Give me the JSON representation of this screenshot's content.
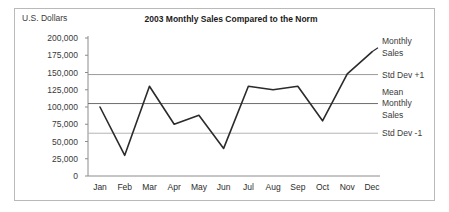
{
  "chart_data": {
    "type": "line",
    "title": "2003 Monthly Sales Compared to the Norm",
    "ylabel": "U.S. Dollars",
    "xlabel": "",
    "categories": [
      "Jan",
      "Feb",
      "Mar",
      "Apr",
      "May",
      "Jun",
      "Jul",
      "Aug",
      "Sep",
      "Oct",
      "Nov",
      "Dec"
    ],
    "series": [
      {
        "name": "Monthly Sales",
        "values": [
          100000,
          30000,
          130000,
          75000,
          88000,
          40000,
          130000,
          125000,
          130000,
          80000,
          148000,
          180000
        ]
      }
    ],
    "reference_lines": [
      {
        "name": "Std Dev +1",
        "label": "Std Dev +1",
        "value": 147000,
        "color": "#9a9a9a"
      },
      {
        "name": "Mean Monthly Sales",
        "label": "Mean\nMonthly\nSales",
        "value": 105000,
        "color": "#6e6e6e"
      },
      {
        "name": "Std Dev -1",
        "label": "Std Dev -1",
        "value": 62000,
        "color": "#b5b5b5"
      }
    ],
    "ylim": [
      0,
      200000
    ],
    "ytick_values": [
      0,
      25000,
      50000,
      75000,
      100000,
      125000,
      150000,
      175000,
      200000
    ],
    "ytick_labels": [
      "0",
      "25,000",
      "50,000",
      "75,000",
      "100,000",
      "125,000",
      "150,000",
      "175,000",
      "200,000"
    ],
    "grid": false,
    "legend_position": "right-inline",
    "series_color": "#2b2b2b",
    "axis_color": "#8c8c8c",
    "frame_color": "#b9b9b9",
    "background_color": "#ffffff"
  },
  "legend": {
    "series_label_line1": "Monthly",
    "series_label_line2": "Sales",
    "mean_label_line1": "Mean",
    "mean_label_line2": "Monthly",
    "mean_label_line3": "Sales",
    "std_plus_label": "Std Dev +1",
    "std_minus_label": "Std Dev -1"
  }
}
